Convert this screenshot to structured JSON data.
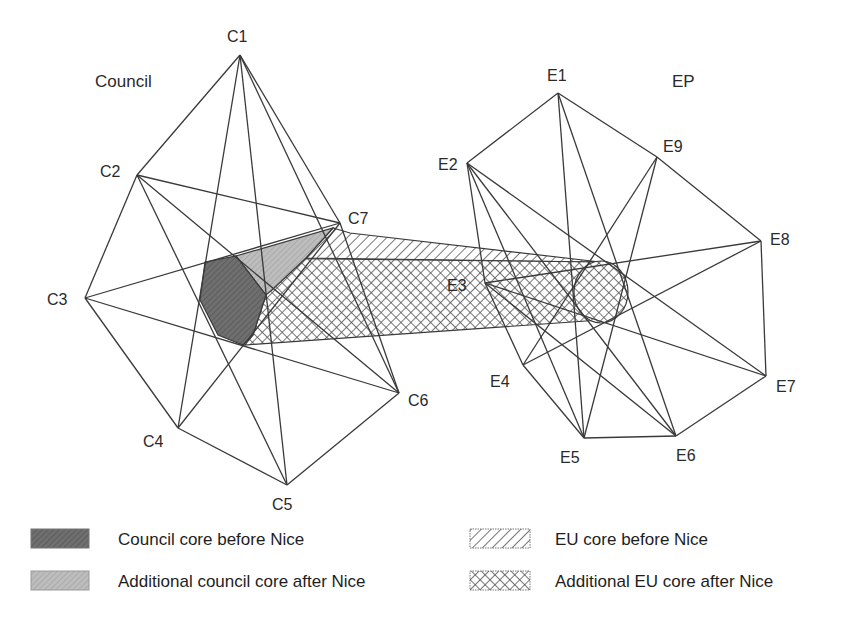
{
  "groups": {
    "council": {
      "label": "Council",
      "x": 95,
      "y": 87
    },
    "ep": {
      "label": "EP",
      "x": 672,
      "y": 87
    }
  },
  "council_nodes": [
    {
      "id": "C1",
      "label": "C1",
      "x": 240,
      "y": 55,
      "lx": 227,
      "ly": 42
    },
    {
      "id": "C2",
      "label": "C2",
      "x": 137,
      "y": 175,
      "lx": 100,
      "ly": 177
    },
    {
      "id": "C3",
      "label": "C3",
      "x": 85,
      "y": 298,
      "lx": 47,
      "ly": 305
    },
    {
      "id": "C4",
      "label": "C4",
      "x": 178,
      "y": 428,
      "lx": 143,
      "ly": 447
    },
    {
      "id": "C5",
      "label": "C5",
      "x": 287,
      "y": 485,
      "lx": 272,
      "ly": 510
    },
    {
      "id": "C6",
      "label": "C6",
      "x": 399,
      "y": 393,
      "lx": 408,
      "ly": 406
    },
    {
      "id": "C7",
      "label": "C7",
      "x": 340,
      "y": 223,
      "lx": 348,
      "ly": 224
    }
  ],
  "council_edges": [
    [
      "C1",
      "C2"
    ],
    [
      "C2",
      "C3"
    ],
    [
      "C3",
      "C4"
    ],
    [
      "C4",
      "C5"
    ],
    [
      "C5",
      "C6"
    ],
    [
      "C6",
      "C7"
    ],
    [
      "C7",
      "C1"
    ],
    [
      "C1",
      "C4"
    ],
    [
      "C1",
      "C5"
    ],
    [
      "C1",
      "C6"
    ],
    [
      "C2",
      "C5"
    ],
    [
      "C2",
      "C6"
    ],
    [
      "C2",
      "C7"
    ],
    [
      "C3",
      "C7"
    ],
    [
      "C3",
      "C6"
    ],
    [
      "C4",
      "C7"
    ]
  ],
  "ep_nodes": [
    {
      "id": "E1",
      "label": "E1",
      "x": 558,
      "y": 93,
      "lx": 547,
      "ly": 81
    },
    {
      "id": "E2",
      "label": "E2",
      "x": 467,
      "y": 163,
      "lx": 438,
      "ly": 170
    },
    {
      "id": "E3",
      "label": "E3",
      "x": 485,
      "y": 283,
      "lx": 447,
      "ly": 291
    },
    {
      "id": "E4",
      "label": "E4",
      "x": 523,
      "y": 365,
      "lx": 490,
      "ly": 387
    },
    {
      "id": "E5",
      "label": "E5",
      "x": 584,
      "y": 438,
      "lx": 560,
      "ly": 463
    },
    {
      "id": "E6",
      "label": "E6",
      "x": 676,
      "y": 436,
      "lx": 676,
      "ly": 461
    },
    {
      "id": "E7",
      "label": "E7",
      "x": 766,
      "y": 376,
      "lx": 776,
      "ly": 392
    },
    {
      "id": "E8",
      "label": "E8",
      "x": 761,
      "y": 241,
      "lx": 770,
      "ly": 245
    },
    {
      "id": "E9",
      "label": "E9",
      "x": 657,
      "y": 157,
      "lx": 663,
      "ly": 152
    }
  ],
  "ep_edges": [
    [
      "E1",
      "E2"
    ],
    [
      "E1",
      "E9"
    ],
    [
      "E9",
      "E8"
    ],
    [
      "E8",
      "E7"
    ],
    [
      "E7",
      "E6"
    ],
    [
      "E6",
      "E5"
    ],
    [
      "E5",
      "E4"
    ],
    [
      "E4",
      "E3"
    ],
    [
      "E3",
      "E2"
    ],
    [
      "E1",
      "E5"
    ],
    [
      "E1",
      "E6"
    ],
    [
      "E2",
      "E6"
    ],
    [
      "E2",
      "E7"
    ],
    [
      "E2",
      "E5"
    ],
    [
      "E3",
      "E8"
    ],
    [
      "E3",
      "E7"
    ],
    [
      "E4",
      "E9"
    ],
    [
      "E4",
      "E8"
    ],
    [
      "E5",
      "E9"
    ],
    [
      "E6",
      "E3"
    ]
  ],
  "regions": {
    "council_core_before": {
      "points": "205,262 236,256 266,295 253,335 243,345 218,335 200,300"
    },
    "council_core_additional": {
      "points": "236,256 333,228 306,258 272,290 266,295"
    },
    "eu_core_before": {
      "points": "333,228 350,233 600,262 306,258"
    },
    "eu_core_additional": {
      "points": "236,258 600,262 600,320 245,345 253,335 266,295"
    },
    "ep_core": {
      "cx": 601,
      "cy": 292,
      "rx": 27,
      "ry": 31
    }
  },
  "legend": {
    "items": [
      {
        "label": "Council core before Nice",
        "pattern": "dark-grey",
        "x": 31,
        "y": 529,
        "tx": 118,
        "ty": 545
      },
      {
        "label": "Additional council core after Nice",
        "pattern": "light-grey",
        "x": 31,
        "y": 571,
        "tx": 118,
        "ty": 587
      },
      {
        "label": "EU core before Nice",
        "pattern": "diagonal-hatch",
        "x": 470,
        "y": 529,
        "tx": 555,
        "ty": 545
      },
      {
        "label": "Additional EU core after Nice",
        "pattern": "cross-hatch",
        "x": 470,
        "y": 571,
        "tx": 555,
        "ty": 587
      }
    ]
  },
  "colors": {
    "line": "#3a3a3a",
    "dark_fill": "#6f6f6f",
    "light_fill": "#b9b9b9",
    "hatch": "#555555"
  }
}
